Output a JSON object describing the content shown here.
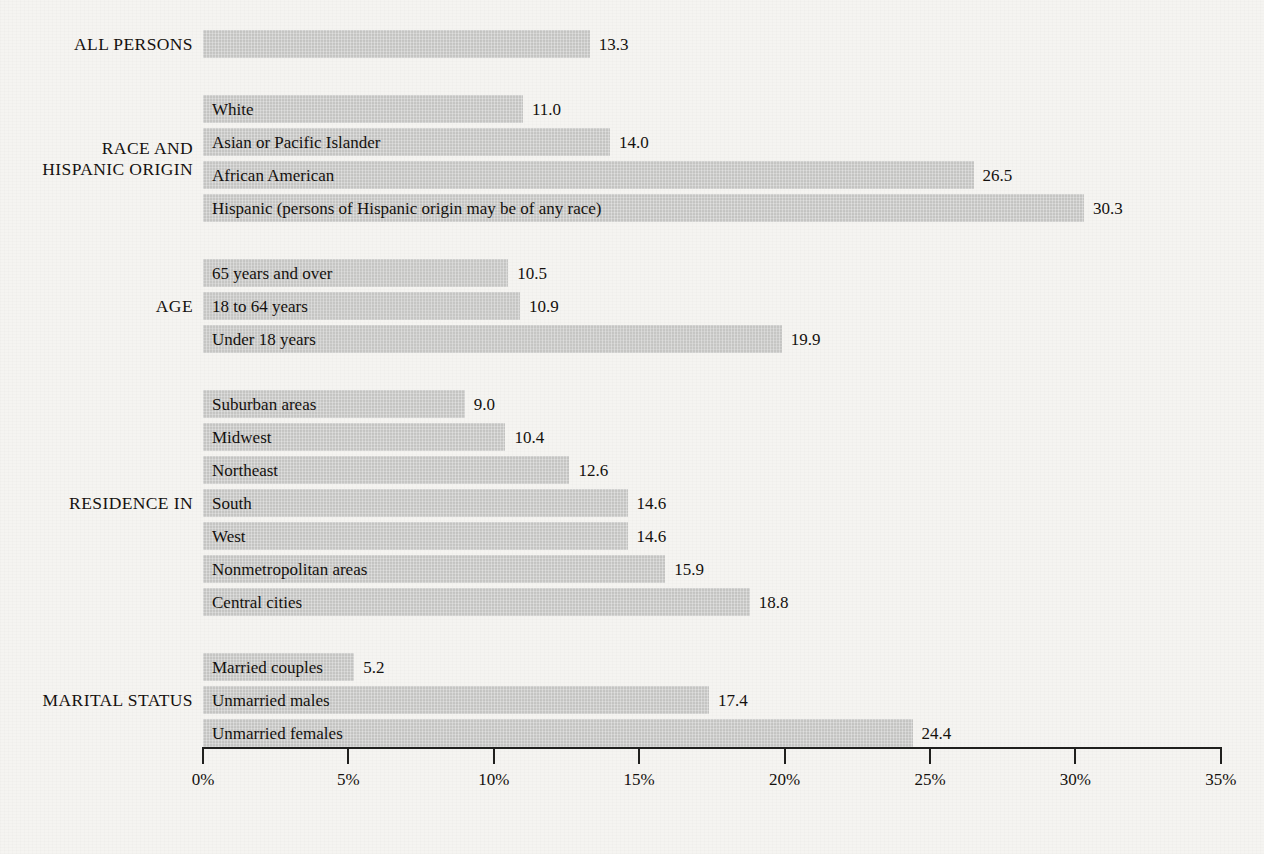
{
  "chart_data": {
    "type": "bar",
    "orientation": "horizontal",
    "title": "",
    "subtitle": "",
    "xlabel": "",
    "ylabel": "",
    "xlim": [
      0,
      35
    ],
    "x_tick_labels": [
      "0%",
      "5%",
      "10%",
      "15%",
      "20%",
      "25%",
      "30%",
      "35%"
    ],
    "x_tick_values": [
      0,
      5,
      10,
      15,
      20,
      25,
      30,
      35
    ],
    "x_tick_step": 5,
    "grid": false,
    "legend": false,
    "value_label_format": "one-decimal",
    "bar_color": "#c6c6c4",
    "text_color": "#14110e",
    "background_color": "#f5f4f1",
    "groups": [
      {
        "label": "ALL PERSONS",
        "items": [
          {
            "category": "",
            "value": 13.3,
            "value_label": "13.3"
          }
        ]
      },
      {
        "label": "RACE AND\nHISPANIC ORIGIN",
        "items": [
          {
            "category": "White",
            "value": 11.0,
            "value_label": "11.0"
          },
          {
            "category": "Asian or Pacific Islander",
            "value": 14.0,
            "value_label": "14.0"
          },
          {
            "category": "African American",
            "value": 26.5,
            "value_label": "26.5"
          },
          {
            "category": "Hispanic (persons of Hispanic origin may be of any race)",
            "value": 30.3,
            "value_label": "30.3"
          }
        ]
      },
      {
        "label": "AGE",
        "items": [
          {
            "category": "65 years and over",
            "value": 10.5,
            "value_label": "10.5"
          },
          {
            "category": "18 to 64 years",
            "value": 10.9,
            "value_label": "10.9"
          },
          {
            "category": "Under 18 years",
            "value": 19.9,
            "value_label": "19.9"
          }
        ]
      },
      {
        "label": "RESIDENCE IN",
        "items": [
          {
            "category": "Suburban areas",
            "value": 9.0,
            "value_label": "9.0"
          },
          {
            "category": "Midwest",
            "value": 10.4,
            "value_label": "10.4"
          },
          {
            "category": "Northeast",
            "value": 12.6,
            "value_label": "12.6"
          },
          {
            "category": "South",
            "value": 14.6,
            "value_label": "14.6"
          },
          {
            "category": "West",
            "value": 14.6,
            "value_label": "14.6"
          },
          {
            "category": "Nonmetropolitan areas",
            "value": 15.9,
            "value_label": "15.9"
          },
          {
            "category": "Central cities",
            "value": 18.8,
            "value_label": "18.8"
          }
        ]
      },
      {
        "label": "MARITAL STATUS",
        "items": [
          {
            "category": "Married couples",
            "value": 5.2,
            "value_label": "5.2"
          },
          {
            "category": "Unmarried males",
            "value": 17.4,
            "value_label": "17.4"
          },
          {
            "category": "Unmarried females",
            "value": 24.4,
            "value_label": "24.4"
          }
        ]
      }
    ]
  },
  "layout": {
    "plot_origin_x": 203,
    "px_per_percent": 29.08,
    "first_row_top": 30,
    "row_height": 28,
    "row_gap": 5,
    "group_gap": 37,
    "axis_y": 747
  }
}
